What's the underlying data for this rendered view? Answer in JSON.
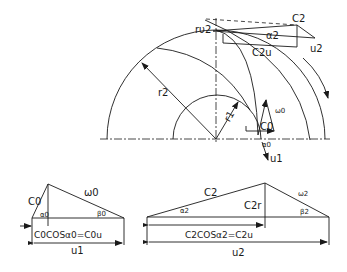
{
  "diagram": {
    "impeller_labels": {
      "outlet_point": "rυ2",
      "c2": "C2",
      "alpha2": "α2",
      "c2u": "C2u",
      "u2": "u2",
      "r2": "r2",
      "r1": "r1",
      "w0": "ω0",
      "c0": "C0",
      "alpha0": "α0",
      "u1": "u1"
    },
    "inlet_triangle": {
      "c0": "C0",
      "alpha0": "α0",
      "w0": "ω0",
      "beta0": "β0",
      "projection": "C0COSα0=C0u",
      "u1": "u1"
    },
    "outlet_triangle": {
      "c2": "C2",
      "alpha2": "α2",
      "c2r": "C2r",
      "w2": "ω2",
      "beta2": "β2",
      "projection": "C2COSα2=C2u",
      "u2": "u2"
    }
  }
}
